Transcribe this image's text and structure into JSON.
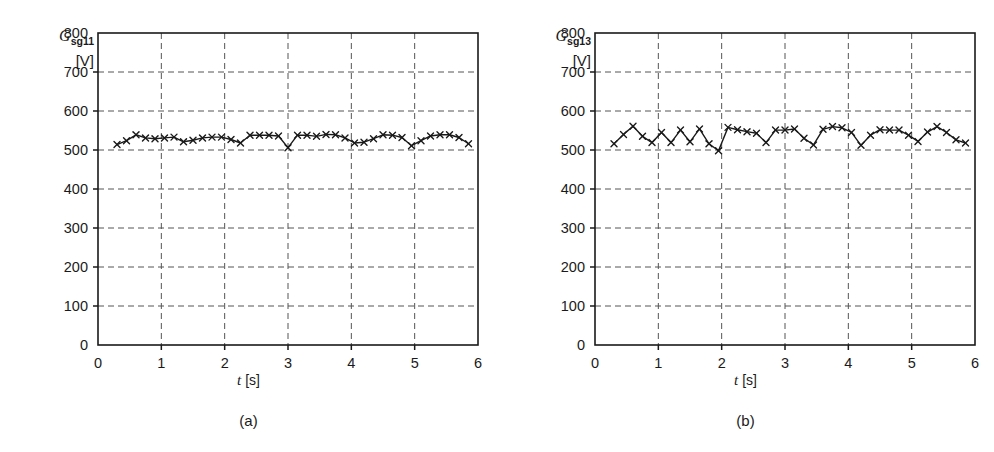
{
  "figure": {
    "panels": [
      {
        "id": "a",
        "caption": "(a)",
        "ylabel_symbol": "G",
        "ylabel_subscript": "sg11",
        "ylabel_unit": "[V]",
        "xlabel_symbol": "t",
        "xlabel_unit": "[s]"
      },
      {
        "id": "b",
        "caption": "(b)",
        "ylabel_symbol": "G",
        "ylabel_subscript": "sg13",
        "ylabel_unit": "[V]",
        "xlabel_symbol": "t",
        "xlabel_unit": "[s]"
      }
    ]
  },
  "chart_data": [
    {
      "type": "line",
      "title": "",
      "panel": "(a)",
      "xlabel": "t [s]",
      "ylabel": "G_sg11 [V]",
      "xlim": [
        0,
        6
      ],
      "ylim": [
        0,
        800
      ],
      "xticks": [
        0,
        1,
        2,
        3,
        4,
        5,
        6
      ],
      "yticks": [
        0,
        100,
        200,
        300,
        400,
        500,
        600,
        700,
        800
      ],
      "xticklabels": [
        "0",
        "1",
        "2",
        "3",
        "4",
        "5",
        "6"
      ],
      "yticklabels": [
        "0",
        "100",
        "200",
        "300",
        "400",
        "500",
        "600",
        "700",
        "800"
      ],
      "grid": true,
      "grid_style": "dashed",
      "grid_x_values": [
        1,
        2,
        3,
        4,
        5
      ],
      "grid_y_values": [
        100,
        200,
        300,
        400,
        500,
        600,
        700
      ],
      "legend": null,
      "marker": "x",
      "color": "#1a1a1a",
      "series": [
        {
          "name": "G_sg11",
          "x": [
            0.3,
            0.45,
            0.6,
            0.75,
            0.9,
            1.05,
            1.2,
            1.35,
            1.5,
            1.65,
            1.8,
            1.95,
            2.1,
            2.25,
            2.4,
            2.55,
            2.7,
            2.85,
            3.0,
            3.15,
            3.3,
            3.45,
            3.6,
            3.75,
            3.9,
            4.05,
            4.2,
            4.35,
            4.5,
            4.65,
            4.8,
            4.95,
            5.1,
            5.25,
            5.4,
            5.55,
            5.7,
            5.85
          ],
          "y": [
            514,
            524,
            539,
            531,
            529,
            531,
            533,
            521,
            525,
            531,
            533,
            533,
            527,
            518,
            538,
            538,
            538,
            536,
            506,
            538,
            538,
            535,
            540,
            539,
            531,
            518,
            520,
            529,
            539,
            538,
            532,
            511,
            524,
            536,
            539,
            539,
            532,
            516
          ]
        }
      ]
    },
    {
      "type": "line",
      "title": "",
      "panel": "(b)",
      "xlabel": "t [s]",
      "ylabel": "G_sg13 [V]",
      "xlim": [
        0,
        6
      ],
      "ylim": [
        0,
        800
      ],
      "xticks": [
        0,
        1,
        2,
        3,
        4,
        5,
        6
      ],
      "yticks": [
        0,
        100,
        200,
        300,
        400,
        500,
        600,
        700,
        800
      ],
      "xticklabels": [
        "0",
        "1",
        "2",
        "3",
        "4",
        "5",
        "6"
      ],
      "yticklabels": [
        "0",
        "100",
        "200",
        "300",
        "400",
        "500",
        "600",
        "700",
        "800"
      ],
      "grid": true,
      "grid_style": "dashed",
      "grid_x_values": [
        1,
        2,
        3,
        4,
        5
      ],
      "grid_y_values": [
        100,
        200,
        300,
        400,
        500,
        600,
        700
      ],
      "legend": null,
      "marker": "x",
      "color": "#1a1a1a",
      "series": [
        {
          "name": "G_sg13",
          "x": [
            0.3,
            0.45,
            0.6,
            0.75,
            0.9,
            1.05,
            1.2,
            1.35,
            1.5,
            1.65,
            1.8,
            1.95,
            2.1,
            2.25,
            2.4,
            2.55,
            2.7,
            2.85,
            3.0,
            3.15,
            3.3,
            3.45,
            3.6,
            3.75,
            3.9,
            4.05,
            4.2,
            4.35,
            4.5,
            4.65,
            4.8,
            4.95,
            5.1,
            5.25,
            5.4,
            5.55,
            5.7,
            5.85
          ],
          "y": [
            516,
            540,
            561,
            535,
            519,
            545,
            519,
            551,
            521,
            554,
            516,
            498,
            558,
            552,
            547,
            543,
            519,
            551,
            551,
            554,
            530,
            513,
            553,
            560,
            557,
            545,
            512,
            538,
            552,
            551,
            551,
            538,
            522,
            546,
            560,
            545,
            526,
            518
          ]
        }
      ]
    }
  ]
}
